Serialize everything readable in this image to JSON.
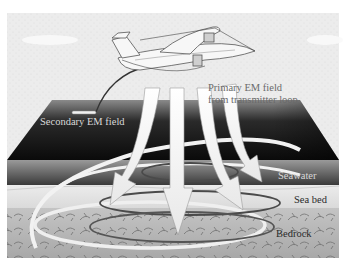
{
  "figure": {
    "labels": {
      "primary_field_line1": "Primary EM field",
      "primary_field_line2": "from transmitter loop",
      "secondary_field": "Secondary EM field",
      "seawater": "Seawater",
      "sea_bed": "Sea bed",
      "bedrock": "Bedrock"
    },
    "elements": {
      "aircraft": "aircraft-icon",
      "tow_cable": "receiver-tow-cable",
      "receiver": "receiver-bird",
      "primary_arrows": 4,
      "secondary_loops": 3
    },
    "colors": {
      "sky": "#eeeeee",
      "sea_surface_dark": "#111111",
      "sea_surface_light": "#7a7a7a",
      "seawater_band": "#5a5a5a",
      "seabed": "#e2e2e2",
      "bedrock": "#b8b8b8",
      "arrow_fill": "#f4f4f4",
      "loop_stroke": "#555555"
    }
  }
}
